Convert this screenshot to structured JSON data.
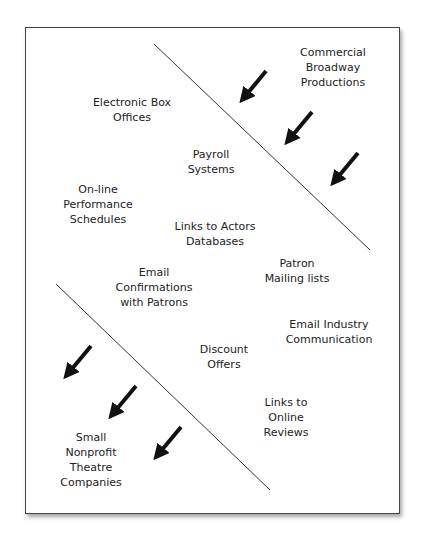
{
  "diagram": {
    "colors": {
      "line": "#333333",
      "arrow": "#111111",
      "text": "#222222",
      "border": "#444444"
    },
    "top_group": {
      "label": [
        "Commercial",
        "Broadway",
        "Productions"
      ]
    },
    "bottom_group": {
      "label": [
        "Small",
        "Nonprofit",
        "Theatre",
        "Companies"
      ]
    },
    "items": [
      {
        "lines": [
          "Electronic Box",
          "Offices"
        ]
      },
      {
        "lines": [
          "Payroll",
          "Systems"
        ]
      },
      {
        "lines": [
          "On-line",
          "Performance",
          "Schedules"
        ]
      },
      {
        "lines": [
          "Links to Actors",
          "Databases"
        ]
      },
      {
        "lines": [
          "Patron",
          "Mailing lists"
        ]
      },
      {
        "lines": [
          "Email",
          "Confirmations",
          "with Patrons"
        ]
      },
      {
        "lines": [
          "Email Industry",
          "Communication"
        ]
      },
      {
        "lines": [
          "Discount",
          "Offers"
        ]
      },
      {
        "lines": [
          "Links to",
          "Online",
          "Reviews"
        ]
      }
    ]
  }
}
